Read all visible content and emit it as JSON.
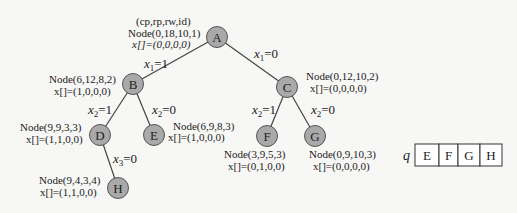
{
  "header": {
    "legend": "(cp,rp,rw,id)"
  },
  "nodes": {
    "A": {
      "label": "A",
      "node": "Node(0,18,10,1)",
      "x": "x[]=(0,0,0,0)"
    },
    "B": {
      "label": "B",
      "node": "Node(6,12,8,2)",
      "x": "x[]=(1,0,0,0)"
    },
    "C": {
      "label": "C",
      "node": "Node(0,12,10,2)",
      "x": "x[]=(0,0,0,0)"
    },
    "D": {
      "label": "D",
      "node": "Node(9,9,3,3)",
      "x": "x[]=(1,1,0,0)"
    },
    "E": {
      "label": "E",
      "node": "Node(6,9,8,3)",
      "x": "x[]=(1,0,0,0)"
    },
    "F": {
      "label": "F",
      "node": "Node(3,9,5,3)",
      "x": "x[]=(0,1,0,0)"
    },
    "G": {
      "label": "G",
      "node": "Node(0,9,10,3)",
      "x": "x[]=(0,0,0,0)"
    },
    "H": {
      "label": "H",
      "node": "Node(9,4,3,4)",
      "x": "x[]=(1,1,0,0)"
    }
  },
  "edges": {
    "AB": {
      "var": "x",
      "sub": "1",
      "val": "=1"
    },
    "AC": {
      "var": "x",
      "sub": "1",
      "val": "=0"
    },
    "BD": {
      "var": "x",
      "sub": "2",
      "val": "=1"
    },
    "BE": {
      "var": "x",
      "sub": "2",
      "val": "=0"
    },
    "CF": {
      "var": "x",
      "sub": "2",
      "val": "=1"
    },
    "CG": {
      "var": "x",
      "sub": "2",
      "val": "=0"
    },
    "DH": {
      "var": "x",
      "sub": "3",
      "val": "=0"
    }
  },
  "queue": {
    "label": "q",
    "items": [
      "E",
      "F",
      "G",
      "H"
    ]
  },
  "colors": {
    "node_fill": "#a9a9a9",
    "node_stroke": "#555555",
    "edge": "#444444"
  }
}
